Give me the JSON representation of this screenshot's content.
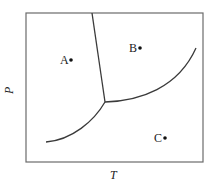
{
  "diagram": {
    "type": "phase-diagram",
    "axes": {
      "x_label": "T",
      "y_label": "P"
    },
    "points": [
      {
        "label": "A",
        "region": "left (solid)"
      },
      {
        "label": "B",
        "region": "upper right (liquid)"
      },
      {
        "label": "C",
        "region": "lower right (gas)"
      }
    ],
    "boundaries": [
      {
        "name": "solid-liquid line",
        "description": "nearly vertical line from top edge down to triple point"
      },
      {
        "name": "liquid-gas curve",
        "description": "curve from triple point rising to upper right"
      },
      {
        "name": "solid-gas curve",
        "description": "curve from lower left rising to triple point"
      }
    ],
    "triple_point": "junction of three curves"
  }
}
